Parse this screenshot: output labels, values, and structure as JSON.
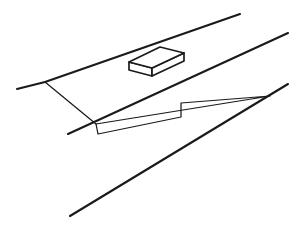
{
  "canvas": {
    "width": 308,
    "height": 226,
    "background_color": "#ffffff",
    "stroke_color": "#1a1a1a",
    "description": "black-and-white line sketch of a sloping road or embankment with a rectangular block resting on it"
  },
  "scene": {
    "title": "line-drawing-sketch",
    "elements": [
      {
        "name": "upper-road-edge-line",
        "kind": "polyline",
        "stroke_width": 2.1,
        "points": "17,89 45,82 240,14"
      },
      {
        "name": "middle-road-edge-line",
        "kind": "polyline",
        "stroke_width": 2.1,
        "points": "68,134 288,33"
      },
      {
        "name": "lower-slope-line",
        "kind": "polyline",
        "stroke_width": 2.1,
        "points": "70,216 288,84"
      },
      {
        "name": "embankment-connector-line",
        "kind": "polyline",
        "stroke_width": 1.25,
        "points": "45,82 96,124"
      },
      {
        "name": "shoulder-polygon-outline",
        "kind": "polyline",
        "stroke_width": 1.25,
        "points": "96,124 98,134 181,117 181,103 270,96 96,124"
      },
      {
        "name": "block-top-face",
        "kind": "polygon",
        "stroke_width": 1.7,
        "points": "129,62 160,47 184,53 152,68"
      },
      {
        "name": "block-front-face",
        "kind": "polygon",
        "stroke_width": 1.7,
        "points": "129,62 152,68 152,76 129,70"
      },
      {
        "name": "block-right-face",
        "kind": "polygon",
        "stroke_width": 1.7,
        "points": "152,68 184,53 184,61 152,76"
      }
    ]
  },
  "geometry": {
    "line_count": 3,
    "block_count": 1,
    "polygon_count": 1
  }
}
